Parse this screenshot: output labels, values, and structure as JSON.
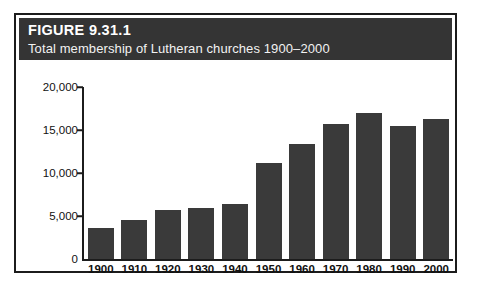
{
  "figure": {
    "number_label": "FIGURE 9.31.1",
    "subtitle": "Total membership of Lutheran churches 1900–2000"
  },
  "colors": {
    "header_band": "#343434",
    "bar_fill": "#3a3a3a",
    "frame": "#1c1c1c",
    "background": "#ffffff",
    "header_text": "#ffffff"
  },
  "chart_data": {
    "type": "bar",
    "title": "FIGURE 9.31.1",
    "subtitle": "Total membership of Lutheran churches 1900–2000",
    "xlabel": "",
    "ylabel": "",
    "categories": [
      "1900",
      "1910",
      "1920",
      "1930",
      "1940",
      "1950",
      "1960",
      "1970",
      "1980",
      "1990",
      "2000"
    ],
    "values": [
      3600,
      4500,
      5700,
      5900,
      6400,
      11200,
      13400,
      15700,
      17000,
      15500,
      16300
    ],
    "ylim": [
      0,
      20000
    ],
    "ytick_labels": [
      "20,000",
      "15,000",
      "10,000",
      "5,000",
      "0"
    ],
    "ytick_values": [
      20000,
      15000,
      10000,
      5000,
      0
    ],
    "grid": false,
    "legend": null
  }
}
